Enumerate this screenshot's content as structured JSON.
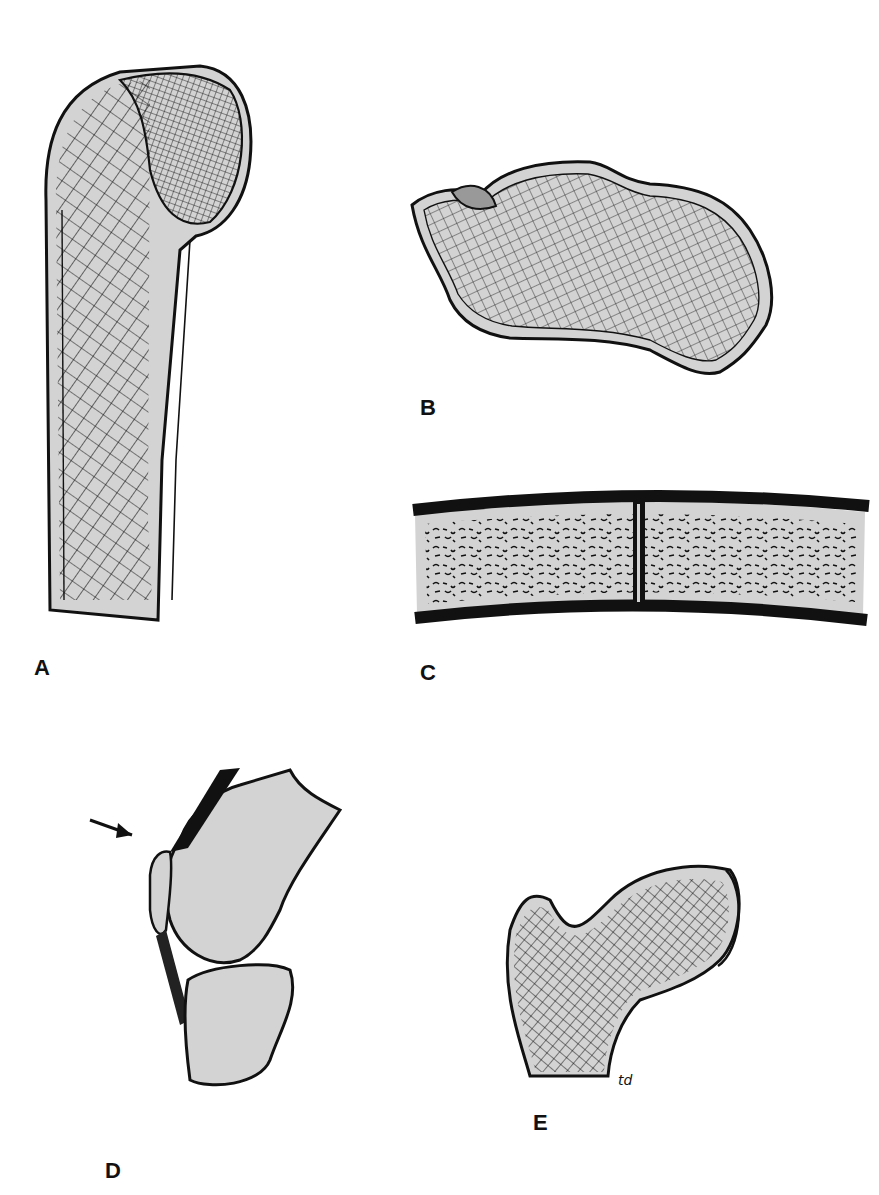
{
  "figure": {
    "colors": {
      "bone_fill": "#d3d3d3",
      "outline": "#111111",
      "background": "#ffffff"
    },
    "panels": [
      {
        "id": "A",
        "label": "A",
        "description": "Proximal humerus with trabecular stress lines"
      },
      {
        "id": "B",
        "label": "B",
        "description": "Calcaneus with trabecular pattern"
      },
      {
        "id": "C",
        "label": "C",
        "description": "Cross-section of bone segment with cancellous interior"
      },
      {
        "id": "D",
        "label": "D",
        "description": "Knee joint sagittal view with patella indicated by arrow"
      },
      {
        "id": "E",
        "label": "E",
        "description": "Proximal femur with trabecular stress lines"
      }
    ],
    "signature": "td"
  }
}
